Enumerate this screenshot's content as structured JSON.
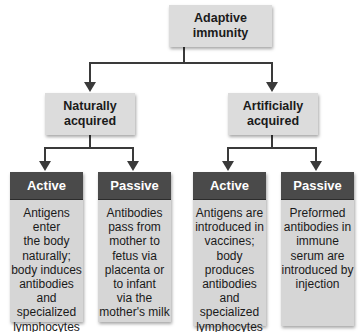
{
  "diagram": {
    "root": {
      "label_line1": "Adaptive",
      "label_line2": "immunity"
    },
    "branches": [
      {
        "label_line1": "Naturally",
        "label_line2": "acquired",
        "children": [
          {
            "header": "Active",
            "body": "Antigens enter\nthe body\nnaturally;\nbody induces\nantibodies\nand\nspecialized\nlymphocytes"
          },
          {
            "header": "Passive",
            "body": "Antibodies\npass from\nmother to\nfetus via\nplacenta or\nto infant\nvia the\nmother's milk"
          }
        ]
      },
      {
        "label_line1": "Artificially",
        "label_line2": "acquired",
        "children": [
          {
            "header": "Active",
            "body": "Antigens are\nintroduced in\nvaccines;\nbody\nproduces\nantibodies\nand\nspecialized\nlymphocytes"
          },
          {
            "header": "Passive",
            "body": "Preformed\nantibodies in\nimmune\nserum are\nintroduced by\ninjection"
          }
        ]
      }
    ],
    "colors": {
      "box_fill": "#dcdcdc",
      "header_fill": "#4a4a4a",
      "header_text": "#ffffff",
      "body_fill": "#d6d6d6",
      "connector": "#3a3a3a"
    }
  }
}
